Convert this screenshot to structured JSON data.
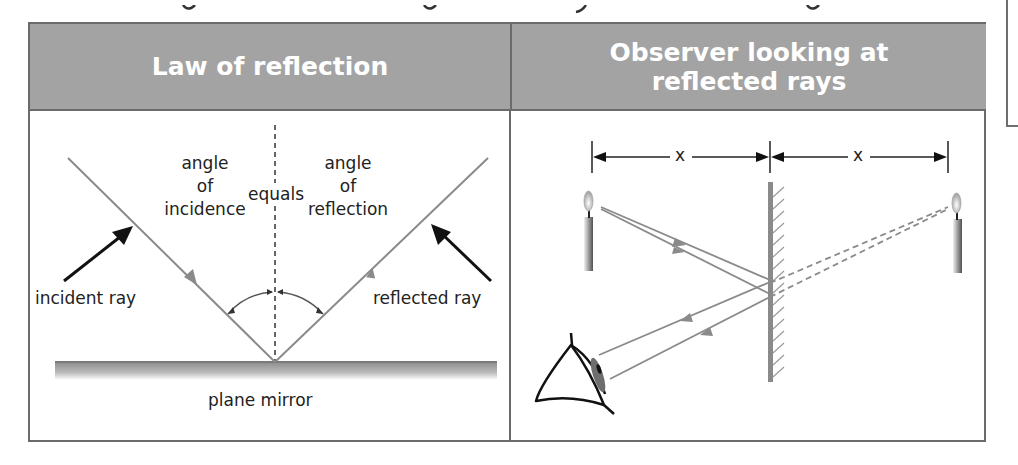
{
  "figure": {
    "top_text_cutoff": true,
    "columns": [
      {
        "header": "Law of reflection",
        "labels": {
          "angle_incidence_line1": "angle",
          "angle_incidence_line2": "of",
          "angle_incidence_line3": "incidence",
          "equals": "equals",
          "angle_reflection_line1": "angle",
          "angle_reflection_line2": "of",
          "angle_reflection_line3": "reflection",
          "incident_ray": "incident ray",
          "reflected_ray": "reflected ray",
          "mirror": "plane mirror"
        }
      },
      {
        "header_line1": "Observer looking at",
        "header_line2": "reflected rays",
        "labels": {
          "distance_left": "x",
          "distance_right": "x"
        }
      }
    ],
    "colors": {
      "header_bg": "#a3a3a3",
      "header_text": "#ffffff",
      "border": "#6b6b6b",
      "ray": "#8a8a8a",
      "arrow_black": "#111111"
    }
  }
}
